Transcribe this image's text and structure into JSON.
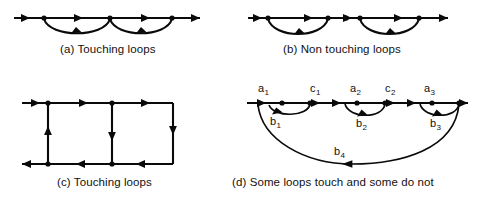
{
  "figure": {
    "background_color": "#ffffff",
    "ink_color": "#0a0a0a",
    "panels": [
      {
        "id": "a",
        "caption": "(a) Touching loops",
        "description": "Horizontal forward path with two self-returning feedback loops that share a common node"
      },
      {
        "id": "b",
        "caption": "(b) Non touching loops",
        "description": "Horizontal forward path with two feedback loops that share no node"
      },
      {
        "id": "c",
        "caption": "(c) Touching loops",
        "description": "Two rectangular loops sharing a common vertical branch"
      },
      {
        "id": "d",
        "caption": "(d) Some loops touch and some do not",
        "description": "Forward path a1 c1 a2 c2 a3 with feedback branches b1 b2 b3 and a long outer feedback branch b4"
      }
    ],
    "branch_labels": {
      "a1": {
        "base": "a",
        "sub": "1"
      },
      "c1": {
        "base": "c",
        "sub": "1"
      },
      "a2": {
        "base": "a",
        "sub": "2"
      },
      "c2": {
        "base": "c",
        "sub": "2"
      },
      "a3": {
        "base": "a",
        "sub": "3"
      },
      "b1": {
        "base": "b",
        "sub": "1"
      },
      "b2": {
        "base": "b",
        "sub": "2"
      },
      "b3": {
        "base": "b",
        "sub": "3"
      },
      "b4": {
        "base": "b",
        "sub": "4"
      }
    }
  }
}
